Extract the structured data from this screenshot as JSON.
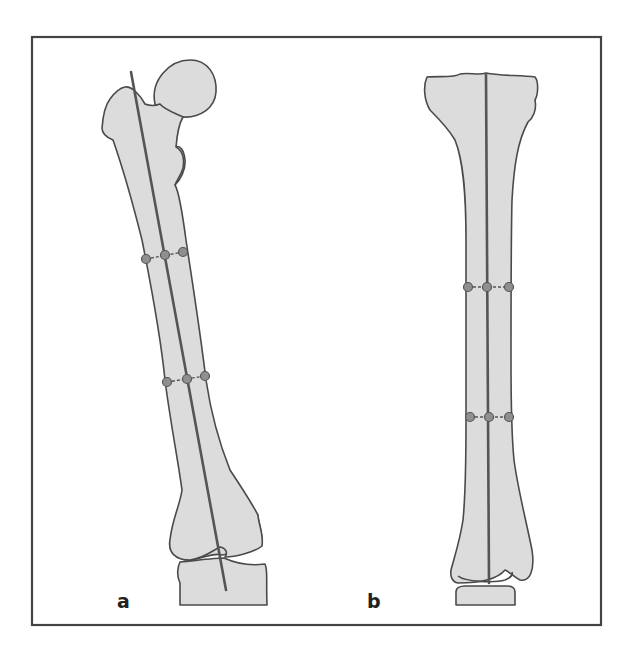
{
  "figure": {
    "panels": [
      {
        "id": "a",
        "label": "a",
        "subject": "femur",
        "view": "anterior view with mechanical/anatomical axis line and two pairs of measurement markers"
      },
      {
        "id": "b",
        "label": "b",
        "subject": "tibia",
        "view": "anterior view with central axis line and two pairs of measurement markers"
      }
    ],
    "colors": {
      "bone_fill": "#dcdcdc",
      "outline": "#4a4a4a",
      "axis_line": "#555555",
      "marker_fill": "#8f8f8f",
      "frame": "#444444",
      "background": "#ffffff"
    }
  }
}
